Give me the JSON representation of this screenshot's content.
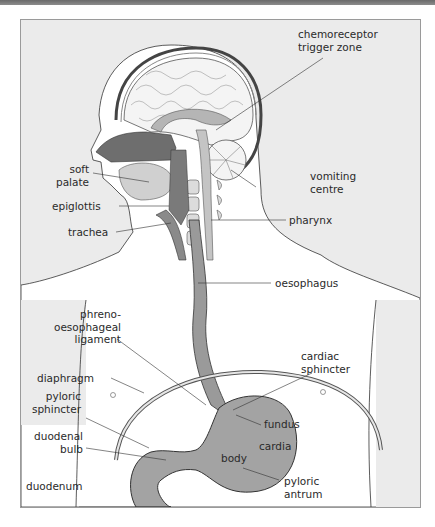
{
  "figure": {
    "colors": {
      "background": "#ebebeb",
      "body_fill": "#ffffff",
      "tissue_dark": "#7d7d7d",
      "tissue_mid": "#a9a9a9",
      "tissue_light": "#cfcfcf",
      "outline": "#333333",
      "frame_border": "#9a9a9a"
    },
    "labels": {
      "chemoreceptor_trigger_zone": "chemoreceptor\ntrigger zone",
      "vomiting_centre": "vomiting\ncentre",
      "soft_palate": "soft\npalate",
      "epiglottis": "epiglottis",
      "pharynx": "pharynx",
      "trachea": "trachea",
      "oesophagus": "oesophagus",
      "phreno_oesophageal_ligament": "phreno-\noesophageal\nligament",
      "cardiac_sphincter": "cardiac\nsphincter",
      "diaphragm": "diaphragm",
      "pyloric_sphincter": "pyloric\nsphincter",
      "fundus": "fundus",
      "cardia": "cardia",
      "duodenal_bulb": "duodenal\nbulb",
      "body": "body",
      "pyloric_antrum": "pyloric\nantrum",
      "duodenum": "duodenum"
    }
  }
}
